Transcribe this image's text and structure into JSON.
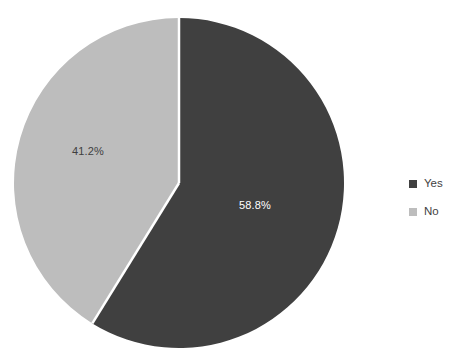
{
  "chart_data": {
    "type": "pie",
    "title": "",
    "subtitle": "",
    "xlabel": "",
    "ylabel": "",
    "grid": false,
    "legend_position": "right",
    "start_angle_deg": 0,
    "direction": "clockwise",
    "categories": [
      "Yes",
      "No"
    ],
    "values": [
      58.8,
      41.2
    ],
    "value_unit": "%",
    "slices": [
      {
        "label": "Yes",
        "value": 58.8,
        "display_value": "58.8%",
        "color": "#404040",
        "label_color": "#ffffff",
        "label_x": 255,
        "label_y": 209
      },
      {
        "label": "No",
        "value": 41.2,
        "display_value": "41.2%",
        "color": "#bdbdbd",
        "label_color": "#3f3f3f",
        "label_x": 88,
        "label_y": 155
      }
    ],
    "annotations": [],
    "geometry": {
      "center_x": 179,
      "center_y": 183,
      "radius": 165,
      "separator_color": "#ffffff",
      "separator_width": 2.5
    },
    "background_color": "#ffffff"
  },
  "legend": {
    "items": [
      {
        "label": "Yes",
        "color": "#404040"
      },
      {
        "label": "No",
        "color": "#bdbdbd"
      }
    ]
  }
}
